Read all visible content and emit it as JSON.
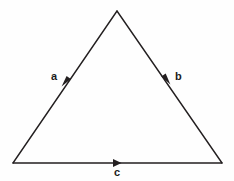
{
  "figure": {
    "background_color": "#fefefe",
    "line_color": "#231f20",
    "label_color": "#1b1b1b"
  },
  "geometry": {
    "apex": {
      "x": 117,
      "y": 11
    },
    "bottom_left": {
      "x": 13,
      "y": 163
    },
    "bottom_right": {
      "x": 222,
      "y": 163
    }
  },
  "vectors": [
    {
      "id": "a",
      "label": "a",
      "side": "left",
      "from": "apex",
      "to": "bottom_left",
      "direction": "down-left",
      "arrowhead": {
        "x": 66,
        "y": 80
      },
      "label_position": {
        "x": 51,
        "y": 71
      }
    },
    {
      "id": "b",
      "label": "b",
      "side": "right",
      "from": "apex",
      "to": "bottom_right",
      "direction": "down-right",
      "arrowhead": {
        "x": 166,
        "y": 78
      },
      "label_position": {
        "x": 175,
        "y": 71
      }
    },
    {
      "id": "c",
      "label": "c",
      "side": "bottom",
      "from": "bottom_left",
      "to": "bottom_right",
      "direction": "right",
      "arrowhead": {
        "x": 117,
        "y": 163
      },
      "label_position": {
        "x": 114,
        "y": 167
      }
    }
  ]
}
